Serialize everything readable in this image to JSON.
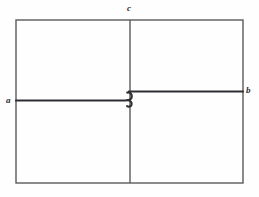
{
  "figure": {
    "kind": "line-diagram",
    "title_text": "",
    "background_color": "#fefefe",
    "stroke_color_thin": "#5a5a5e",
    "stroke_color_thick": "#2e2e32",
    "canvas": {
      "width": 259,
      "height": 197
    },
    "labels": [
      {
        "id": "a",
        "text": "a",
        "x": 6,
        "y": 96,
        "style": "italic-serif"
      },
      {
        "id": "b",
        "text": "b",
        "x": 246,
        "y": 86,
        "style": "italic-serif"
      },
      {
        "id": "c",
        "text": "c",
        "x": 127,
        "y": 4,
        "style": "italic-serif"
      }
    ],
    "shapes": {
      "outer_rectangle": {
        "x1": 16,
        "y1": 20,
        "x2": 243,
        "y2": 183,
        "stroke_width": 1.4
      },
      "vertical_divider": {
        "x": 130,
        "y1": 20,
        "y2": 183,
        "stroke_width": 1.4
      },
      "line_a": {
        "label": "a",
        "from_x": 16,
        "from_y": 100,
        "to_x": 126,
        "to_y": 100,
        "stroke_width": 2.1
      },
      "line_b": {
        "label": "b",
        "from_x": 134,
        "from_y": 91,
        "to_x": 243,
        "to_y": 91,
        "stroke_width": 2.1
      },
      "center_crossover": {
        "description": "s-hook",
        "x": 130,
        "y_upper": 91,
        "y_lower": 100,
        "stroke_width": 2.1
      }
    }
  }
}
